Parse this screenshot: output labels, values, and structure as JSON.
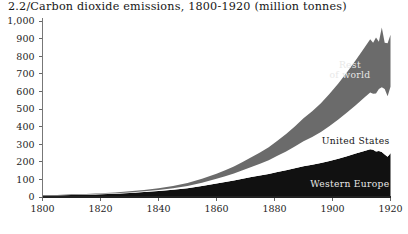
{
  "chart_title": "2.2/Carbon dioxide emissions, 1800-1920 (million tonnes)",
  "series_labels": {
    "rest_of_world_line1": "Rest",
    "rest_of_world_line2": "of world",
    "united_states": "United States",
    "western_europe": "Western Europe"
  },
  "colors": {
    "western_europe": "#111111",
    "united_states": "#ffffff",
    "rest_of_world": "#6b6b6b",
    "axis": "#777777",
    "text": "#1a1a1a",
    "background": "#ffffff"
  },
  "chart_data": {
    "type": "area",
    "title": "2.2/Carbon dioxide emissions, 1800-1920 (million tonnes)",
    "xlabel": "",
    "ylabel": "",
    "xlim": [
      1800,
      1920
    ],
    "ylim": [
      0,
      1000
    ],
    "grid": false,
    "legend_position": "inline-annotations",
    "stacked": true,
    "x_tick_labels": [
      "1800",
      "1820",
      "1840",
      "1860",
      "1880",
      "1900",
      "1920"
    ],
    "x_ticks": [
      1800,
      1820,
      1840,
      1860,
      1880,
      1900,
      1920
    ],
    "y_tick_labels": [
      "0",
      "100",
      "200",
      "300",
      "400",
      "500",
      "600",
      "700",
      "800",
      "900",
      "1,000"
    ],
    "y_ticks": [
      0,
      100,
      200,
      300,
      400,
      500,
      600,
      700,
      800,
      900,
      1000
    ],
    "x": [
      1800,
      1805,
      1810,
      1815,
      1820,
      1825,
      1830,
      1835,
      1840,
      1845,
      1850,
      1855,
      1860,
      1863,
      1866,
      1869,
      1872,
      1875,
      1878,
      1881,
      1884,
      1887,
      1890,
      1893,
      1896,
      1899,
      1902,
      1905,
      1908,
      1911,
      1913,
      1914,
      1915,
      1916,
      1917,
      1918,
      1919,
      1920
    ],
    "series": [
      {
        "name": "Western Europe",
        "color": "#111111",
        "values": [
          8,
          9,
          11,
          13,
          16,
          19,
          23,
          28,
          34,
          41,
          50,
          62,
          76,
          85,
          94,
          104,
          114,
          122,
          131,
          142,
          152,
          163,
          175,
          183,
          193,
          205,
          218,
          232,
          247,
          262,
          272,
          268,
          258,
          262,
          255,
          242,
          228,
          248
        ]
      },
      {
        "name": "United States",
        "color": "#ffffff",
        "values": [
          0,
          0,
          1,
          1,
          2,
          2,
          3,
          4,
          6,
          9,
          13,
          19,
          27,
          33,
          40,
          48,
          57,
          67,
          78,
          92,
          107,
          124,
          142,
          158,
          176,
          198,
          222,
          248,
          275,
          303,
          322,
          318,
          330,
          352,
          368,
          372,
          345,
          378
        ]
      },
      {
        "name": "Rest of world",
        "color": "#6b6b6b",
        "values": [
          2,
          2,
          3,
          3,
          4,
          5,
          6,
          8,
          10,
          13,
          17,
          22,
          29,
          34,
          40,
          47,
          55,
          64,
          74,
          86,
          99,
          114,
          131,
          146,
          163,
          183,
          205,
          229,
          255,
          283,
          302,
          290,
          318,
          268,
          340,
          262,
          300,
          296
        ]
      }
    ],
    "totals_note": "Stacked totals rise from roughly 10 in 1800 to about 920 in 1920",
    "annotations": [
      {
        "text": "Rest of world",
        "series": "Rest of world",
        "approx_x": 1905,
        "approx_y": 700
      },
      {
        "text": "United States",
        "series": "United States",
        "approx_x": 1900,
        "approx_y": 305
      },
      {
        "text": "Western Europe",
        "series": "Western Europe",
        "approx_x": 1903,
        "approx_y": 60
      }
    ]
  }
}
